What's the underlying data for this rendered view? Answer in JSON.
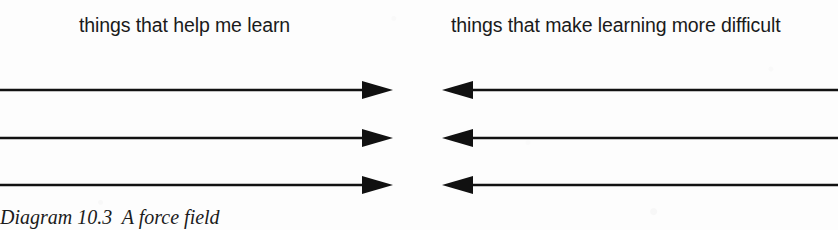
{
  "figure": {
    "caption": "Diagram 10.3  A force field",
    "line_color": "#111111",
    "text_color": "#1a1a1a",
    "background_color": "#fdfdfd"
  },
  "columns": {
    "left": {
      "heading": "things that help me learn",
      "arrow_direction": "right",
      "arrow_count": 3
    },
    "right": {
      "heading": "things that make learning more difficult",
      "arrow_direction": "left",
      "arrow_count": 3
    }
  },
  "rows": [
    {
      "label": "force-pair-1"
    },
    {
      "label": "force-pair-2"
    },
    {
      "label": "force-pair-3"
    }
  ]
}
